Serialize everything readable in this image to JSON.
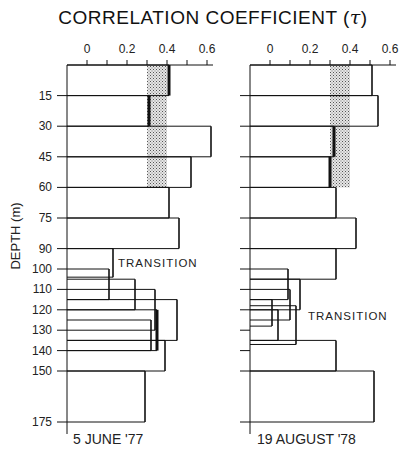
{
  "chart_data": {
    "type": "bar",
    "orientation": "horizontal-step (depth profile)",
    "title": "CORRELATION COEFFICIENT (τ)",
    "xlabel": "CORRELATION COEFFICIENT (τ)",
    "ylabel": "DEPTH (m)",
    "xticks": [
      "0",
      "0.2",
      "0.4",
      "0.6"
    ],
    "xlim": [
      -0.1,
      0.65
    ],
    "yticks": [
      15,
      30,
      45,
      60,
      75,
      90,
      100,
      110,
      120,
      130,
      140,
      150,
      175
    ],
    "ylim": [
      0,
      175
    ],
    "shaded_band": {
      "from": 0.3,
      "to": 0.4,
      "pattern": "stipple",
      "description": "significance band"
    },
    "panels": [
      {
        "caption": "5 JUNE '77",
        "annotation": {
          "text": "TRANSITION",
          "depth": 97
        },
        "band_depth": [
          0,
          60
        ],
        "bars": [
          {
            "top": 0,
            "bottom": 15,
            "value": 0.41,
            "bold": true
          },
          {
            "top": 15,
            "bottom": 30,
            "value": 0.31,
            "bold": true
          },
          {
            "top": 30,
            "bottom": 45,
            "value": 0.62,
            "bold": false
          },
          {
            "top": 45,
            "bottom": 60,
            "value": 0.52,
            "bold": false
          },
          {
            "top": 60,
            "bottom": 75,
            "value": 0.41,
            "bold": false
          },
          {
            "top": 75,
            "bottom": 90,
            "value": 0.46,
            "bold": false
          },
          {
            "top": 90,
            "bottom": 104,
            "value": 0.13,
            "bold": false
          },
          {
            "top": 100,
            "bottom": 115,
            "value": 0.11,
            "bold": false
          },
          {
            "top": 105,
            "bottom": 120,
            "value": 0.24,
            "bold": false
          },
          {
            "top": 110,
            "bottom": 130,
            "value": 0.34,
            "bold": false
          },
          {
            "top": 115,
            "bottom": 135,
            "value": 0.45,
            "bold": false
          },
          {
            "top": 120,
            "bottom": 140,
            "value": 0.35,
            "bold": true
          },
          {
            "top": 125,
            "bottom": 140,
            "value": 0.32,
            "bold": false
          },
          {
            "top": 135,
            "bottom": 150,
            "value": 0.39,
            "bold": false
          },
          {
            "top": 150,
            "bottom": 175,
            "value": 0.29,
            "bold": false
          }
        ]
      },
      {
        "caption": "19 AUGUST '78",
        "annotation": {
          "text": "TRANSITION",
          "depth": 123
        },
        "band_depth": [
          0,
          60
        ],
        "bars": [
          {
            "top": 0,
            "bottom": 15,
            "value": 0.51,
            "bold": false
          },
          {
            "top": 15,
            "bottom": 30,
            "value": 0.54,
            "bold": false
          },
          {
            "top": 30,
            "bottom": 45,
            "value": 0.32,
            "bold": true
          },
          {
            "top": 45,
            "bottom": 60,
            "value": 0.3,
            "bold": true
          },
          {
            "top": 60,
            "bottom": 75,
            "value": 0.33,
            "bold": false
          },
          {
            "top": 75,
            "bottom": 90,
            "value": 0.43,
            "bold": false
          },
          {
            "top": 90,
            "bottom": 105,
            "value": 0.33,
            "bold": false
          },
          {
            "top": 100,
            "bottom": 115,
            "value": 0.09,
            "bold": false
          },
          {
            "top": 105,
            "bottom": 120,
            "value": 0.15,
            "bold": false
          },
          {
            "top": 110,
            "bottom": 125,
            "value": 0.1,
            "bold": false
          },
          {
            "top": 115,
            "bottom": 128,
            "value": 0.01,
            "bold": false
          },
          {
            "top": 120,
            "bottom": 135,
            "value": 0.04,
            "bold": false
          },
          {
            "top": 118,
            "bottom": 137,
            "value": 0.13,
            "bold": false
          },
          {
            "top": 135,
            "bottom": 150,
            "value": 0.33,
            "bold": false
          },
          {
            "top": 150,
            "bottom": 175,
            "value": 0.52,
            "bold": false
          }
        ]
      }
    ],
    "grid": false,
    "legend": null
  },
  "title_text": "CORRELATION COEFFICIENT (",
  "title_tau": "τ",
  "title_close": ")",
  "ylabel_text": "DEPTH (m)",
  "colors": {
    "ink": "#111111",
    "band": "#888888",
    "background": "#ffffff"
  }
}
